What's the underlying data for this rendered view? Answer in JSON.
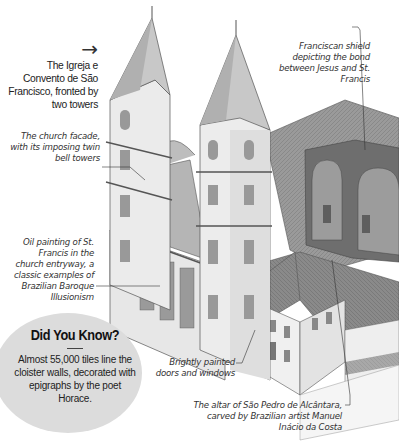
{
  "title": {
    "arrow": "→",
    "text": "The Igreja e Convento de São Francisco, fronted by two towers"
  },
  "labels": {
    "shield": "Franciscan shield depicting the bond between Jesus and St. Francis",
    "facade": "The church facade, with its imposing twin bell towers",
    "painting": "Oil painting of St. Francis in the church entryway, a classic examples of Brazilian Baroque Illusionism",
    "doors": "Brightly painted doors and windows",
    "altar": "The altar of São Pedro de Alcântara, carved by Brazilian artist Manuel Inácio da Costa"
  },
  "did_you_know": {
    "heading": "Did You Know?",
    "body": "Almost 55,000 tiles line the cloister walls, decorated with epigraphs by the poet Horace."
  },
  "colors": {
    "background": "#ffffff",
    "badge": "#dcdcdc",
    "stone": "#e9e9e9",
    "roof": "#8f8f8f",
    "line": "#555555"
  }
}
